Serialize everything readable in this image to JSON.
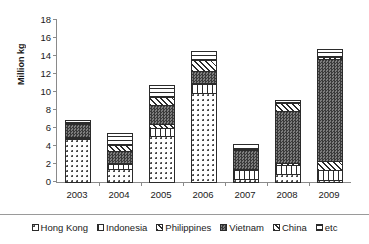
{
  "chart_data": {
    "type": "bar",
    "stacked": true,
    "title": "",
    "xlabel": "",
    "ylabel": "Million kg",
    "ylim": [
      0,
      18
    ],
    "ytick_step": 2,
    "yticks": [
      18,
      16,
      14,
      12,
      10,
      8,
      6,
      4,
      2,
      0
    ],
    "grid": false,
    "legend_position": "bottom",
    "categories": [
      "2003",
      "2004",
      "2005",
      "2006",
      "2007",
      "2008",
      "2009"
    ],
    "series": [
      {
        "name": "Hong Kong",
        "pattern": "dotted",
        "values": [
          4.9,
          1.6,
          5.2,
          10.0,
          0.5,
          1.0,
          0.3
        ]
      },
      {
        "name": "Indonesia",
        "pattern": "vertical-lines",
        "values": [
          0.1,
          0.6,
          1.0,
          1.1,
          1.1,
          1.1,
          1.3
        ]
      },
      {
        "name": "Philippines",
        "pattern": "diagonal-hatch",
        "values": [
          0.1,
          0.1,
          0.6,
          0.1,
          0.1,
          0.3,
          1.1
        ]
      },
      {
        "name": "Vietnam",
        "pattern": "dark-checker",
        "values": [
          1.5,
          1.5,
          2.2,
          1.5,
          2.2,
          5.9,
          11.4
        ]
      },
      {
        "name": "China",
        "pattern": "diagonal-hatch-2",
        "values": [
          0.2,
          0.7,
          1.0,
          1.3,
          0.1,
          1.0,
          0.4
        ]
      },
      {
        "name": "etc",
        "pattern": "horizontal-lines",
        "values": [
          0.5,
          1.5,
          1.4,
          1.1,
          0.7,
          0.5,
          1.0
        ]
      }
    ],
    "totals": [
      7.3,
      6.0,
      11.4,
      15.1,
      4.7,
      9.8,
      15.5
    ]
  },
  "colors": {
    "axis": "#8a8a8a",
    "text": "#1a1a1a",
    "bar_outline": "#2b2b2b",
    "background": "#ffffff",
    "vietnam_fill": "#4d4d4d"
  }
}
